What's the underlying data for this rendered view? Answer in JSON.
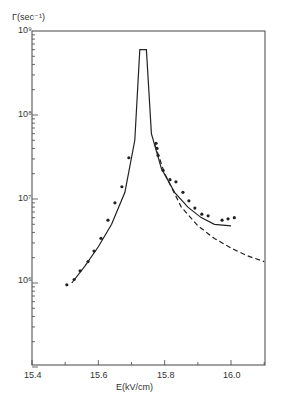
{
  "chart_data": {
    "type": "scatter",
    "title": "",
    "xlabel": "E (kV/cm)",
    "ylabel": "Γ(sec⁻¹)",
    "xlim": [
      15.4,
      16.1
    ],
    "ylim": [
      100000.0,
      1000000000.0
    ],
    "yscale": "log",
    "xticks": [
      "15.4",
      "15.6",
      "15.8",
      "16.0"
    ],
    "yticks": [
      "10⁶",
      "10⁷",
      "10⁸",
      "10⁹"
    ],
    "grid": false,
    "legend": "none",
    "series": [
      {
        "name": "measured",
        "style": "points",
        "x": [
          15.505,
          15.527,
          15.545,
          15.569,
          15.587,
          15.608,
          15.629,
          15.65,
          15.671,
          15.692,
          15.774,
          15.777,
          15.78,
          15.795,
          15.816,
          15.834,
          15.855,
          15.873,
          15.891,
          15.912,
          15.931,
          15.973,
          15.991,
          16.01
        ],
        "y": [
          950000.0,
          1100000.0,
          1400000.0,
          1800000.0,
          2400000.0,
          3400000.0,
          5600000.0,
          9000000.0,
          14000000.0,
          31000000.0,
          46000000.0,
          40000000.0,
          33000000.0,
          22000000.0,
          17000000.0,
          16000000.0,
          12000000.0,
          9500000.0,
          7800000.0,
          6600000.0,
          6300000.0,
          5600000.0,
          5800000.0,
          6000000.0
        ]
      },
      {
        "name": "theory (solid)",
        "style": "solid",
        "x": [
          15.52,
          15.56,
          15.6,
          15.64,
          15.68,
          15.71,
          15.725,
          15.745,
          15.76,
          15.79,
          15.83,
          15.87,
          15.91,
          15.95,
          16.0
        ],
        "y": [
          1000000.0,
          1600000.0,
          2700000.0,
          5000000.0,
          12000000.0,
          50000000.0,
          600000000.0,
          600000000.0,
          60000000.0,
          23000000.0,
          12000000.0,
          8000000.0,
          6000000.0,
          5000000.0,
          4800000.0
        ]
      },
      {
        "name": "theory (dashed)",
        "style": "dashed",
        "x": [
          15.77,
          15.8,
          15.85,
          15.9,
          15.95,
          16.0,
          16.05,
          16.1
        ],
        "y": [
          45000000.0,
          20000000.0,
          8000000.0,
          4800000.0,
          3400000.0,
          2600000.0,
          2100000.0,
          1800000.0
        ]
      }
    ]
  },
  "labels": {
    "ylabel": "Γ(sec⁻¹)",
    "xlabel": "E(kV/cm)",
    "yticks": [
      "10⁹",
      "10⁸",
      "10⁷",
      "10⁶"
    ],
    "xticks": [
      "15.4",
      "15.6",
      "15.8",
      "16.0"
    ]
  }
}
